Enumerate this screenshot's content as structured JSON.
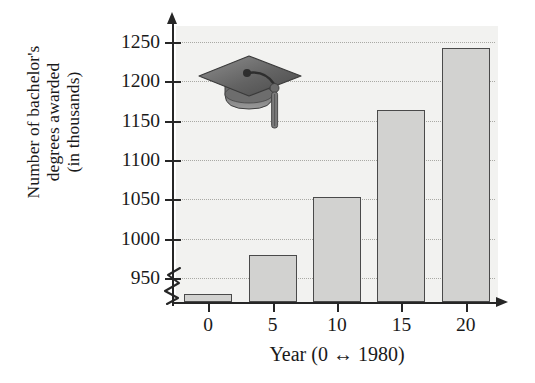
{
  "chart_data": {
    "type": "bar",
    "title": "",
    "subtitle": "",
    "xlabel": "Year (0 ↔ 1980)",
    "ylabel": "Number of bachelor's degrees awarded (in thousands)",
    "ylabel_lines": [
      "Number of bachelor's",
      "degrees awarded",
      "(in thousands)"
    ],
    "categories": [
      "0",
      "5",
      "10",
      "15",
      "20"
    ],
    "x": [
      0,
      5,
      10,
      15,
      20
    ],
    "values": [
      930,
      980,
      1053,
      1163,
      1242
    ],
    "ylim": [
      920,
      1270
    ],
    "yticks": [
      950,
      1000,
      1050,
      1100,
      1150,
      1200,
      1250
    ],
    "ytick_labels": [
      "950",
      "1000",
      "1050",
      "1100",
      "1150",
      "1200",
      "1250"
    ],
    "xtick_labels": [
      "0",
      "5",
      "10",
      "15",
      "20"
    ],
    "grid": true,
    "grid_style": "dotted horizontal",
    "legend": "none",
    "axis_break": true,
    "axis_break_note": "y-axis broken below 950",
    "annotations": [
      "graduation-cap decoration"
    ],
    "colors": {
      "bar_fill": "#d2d2d0",
      "bar_edge": "#4a4a4a",
      "plot_background": "#f2f2f0",
      "axis": "#262626",
      "gridline": "#a9a9a4",
      "text": "#1a1a1a"
    }
  },
  "icons": {
    "graduation_cap": "graduation-cap-icon"
  }
}
